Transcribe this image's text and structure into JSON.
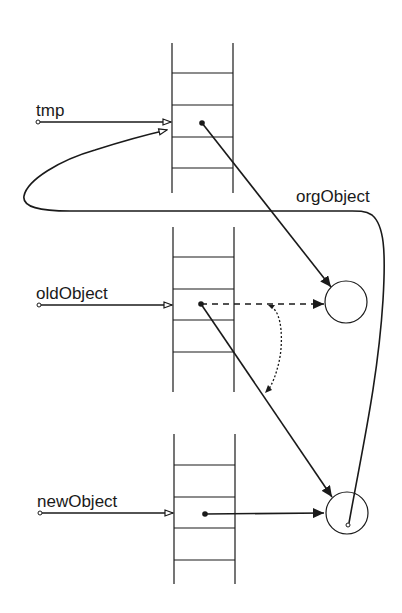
{
  "labels": {
    "tmp": "tmp",
    "orgObject": "orgObject",
    "oldObject": "oldObject",
    "newObject": "newObject"
  },
  "colors": {
    "stroke": "#1a1a1a",
    "background": "#ffffff"
  },
  "stacks": [
    {
      "name": "tmp-stack",
      "x": 172,
      "width": 61,
      "top": 43,
      "bottom": 193,
      "rungs": [
        73,
        105,
        137,
        168
      ]
    },
    {
      "name": "oldObject-stack",
      "x": 173,
      "width": 61,
      "top": 227,
      "bottom": 392,
      "rungs": [
        257,
        289,
        320,
        352
      ]
    },
    {
      "name": "newObject-stack",
      "x": 174,
      "width": 61,
      "top": 434,
      "bottom": 584,
      "rungs": [
        465,
        497,
        528,
        560
      ]
    }
  ],
  "objects": [
    {
      "name": "object-circle-1",
      "cx": 346,
      "cy": 302,
      "r": 21
    },
    {
      "name": "object-circle-2",
      "cx": 347,
      "cy": 513,
      "r": 21
    }
  ]
}
